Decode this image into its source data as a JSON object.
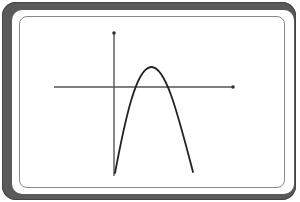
{
  "diagram": {
    "type": "parabola-graph",
    "colors": {
      "frame": "#5a5a5a",
      "inner_border": "#8a8a8a",
      "axes": "#555555",
      "curve": "#222222",
      "background": "#ffffff"
    },
    "axes": {
      "y_axis": {
        "x": 114,
        "y_top": 32,
        "y_bottom": 176
      },
      "x_axis": {
        "y": 87,
        "x_left": 54,
        "x_right": 233
      }
    },
    "curve": {
      "shape": "parabola-opening-down",
      "vertex": [
        151,
        67
      ],
      "left_end": [
        115,
        173
      ],
      "right_end": [
        193,
        172
      ]
    }
  }
}
